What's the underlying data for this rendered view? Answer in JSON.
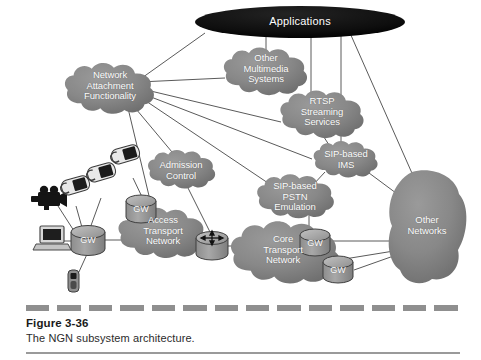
{
  "figure": {
    "caption_title": "Figure 3-36",
    "caption_text": "The NGN subsystem architecture.",
    "colors": {
      "cloud_fill": "#8a8a8a",
      "cloud_fill_dark": "#6f6f6f",
      "apps_fill": "#0d0d0d",
      "line": "#5a5a5a",
      "label_text": "#ffffff",
      "gw_fill": "#9d9d9d",
      "device_dark": "#1a1a1a",
      "dash_rule": "#8f8f8f"
    },
    "nodes": [
      {
        "id": "applications",
        "label": "Applications",
        "shape": "ellipse",
        "x": 300,
        "y": 22,
        "interactable": false
      },
      {
        "id": "network-attachment",
        "label": "Network\nAttachment\nFunctionality",
        "shape": "cloud",
        "x": 110,
        "y": 88,
        "interactable": false
      },
      {
        "id": "other-multimedia",
        "label": "Other\nMultimedia\nSystems",
        "shape": "cloud",
        "x": 265,
        "y": 70,
        "interactable": false
      },
      {
        "id": "rtsp-streaming",
        "label": "RTSP\nStreaming\nServices",
        "shape": "cloud",
        "x": 322,
        "y": 112,
        "interactable": false
      },
      {
        "id": "sip-ims",
        "label": "SIP-based\nIMS",
        "shape": "cloud",
        "x": 345,
        "y": 157,
        "interactable": false
      },
      {
        "id": "sip-pstn",
        "label": "SIP-based\nPSTN\nEmulation",
        "shape": "cloud",
        "x": 295,
        "y": 195,
        "interactable": false
      },
      {
        "id": "admission-control",
        "label": "Admission\nControl",
        "shape": "cloud",
        "x": 180,
        "y": 168,
        "interactable": false
      },
      {
        "id": "access-transport",
        "label": "Access\nTransport\nNetwork",
        "shape": "cloud",
        "x": 162,
        "y": 230,
        "interactable": false
      },
      {
        "id": "core-transport",
        "label": "Core\nTransport\nNetwork",
        "shape": "cloud",
        "x": 283,
        "y": 248,
        "interactable": false
      },
      {
        "id": "other-networks",
        "label": "Other\nNetworks",
        "shape": "cloud",
        "x": 425,
        "y": 228,
        "interactable": false
      }
    ],
    "gateways": [
      {
        "id": "gw-access-top",
        "label": "GW",
        "x": 141,
        "y": 207
      },
      {
        "id": "gw-cpe",
        "label": "GW",
        "x": 88,
        "y": 238
      },
      {
        "id": "gw-core-upper",
        "label": "GW",
        "x": 315,
        "y": 241
      },
      {
        "id": "gw-core-lower",
        "label": "GW",
        "x": 338,
        "y": 268
      }
    ],
    "devices": [
      {
        "id": "video-camera",
        "kind": "camera-icon",
        "x": 44,
        "y": 200
      },
      {
        "id": "phone-1",
        "kind": "telephone-icon",
        "x": 72,
        "y": 193
      },
      {
        "id": "phone-2",
        "kind": "telephone-icon",
        "x": 98,
        "y": 180
      },
      {
        "id": "phone-3",
        "kind": "telephone-icon",
        "x": 123,
        "y": 162
      },
      {
        "id": "laptop",
        "kind": "laptop-icon",
        "x": 50,
        "y": 236
      },
      {
        "id": "mobile-phone",
        "kind": "mobile-phone-icon",
        "x": 73,
        "y": 276
      },
      {
        "id": "router",
        "kind": "router-icon",
        "x": 212,
        "y": 245
      }
    ],
    "links": [
      {
        "from": "applications",
        "to": "network-attachment"
      },
      {
        "from": "applications",
        "to": "other-multimedia"
      },
      {
        "from": "applications",
        "to": "rtsp-streaming"
      },
      {
        "from": "applications",
        "to": "sip-ims"
      },
      {
        "from": "applications",
        "to": "other-networks"
      },
      {
        "from": "network-attachment",
        "to": "other-multimedia"
      },
      {
        "from": "network-attachment",
        "to": "rtsp-streaming"
      },
      {
        "from": "network-attachment",
        "to": "sip-ims"
      },
      {
        "from": "network-attachment",
        "to": "sip-pstn"
      },
      {
        "from": "network-attachment",
        "to": "admission-control"
      },
      {
        "from": "network-attachment",
        "to": "access-transport"
      },
      {
        "from": "rtsp-streaming",
        "to": "sip-ims"
      },
      {
        "from": "sip-ims",
        "to": "sip-pstn"
      },
      {
        "from": "sip-ims",
        "to": "other-networks"
      },
      {
        "from": "sip-pstn",
        "to": "core-transport"
      },
      {
        "from": "admission-control",
        "to": "router"
      },
      {
        "from": "access-transport",
        "to": "router"
      },
      {
        "from": "core-transport",
        "to": "router"
      },
      {
        "from": "core-transport",
        "to": "other-networks"
      },
      {
        "from": "gw-core-upper",
        "to": "other-networks"
      },
      {
        "from": "gw-core-lower",
        "to": "other-networks"
      },
      {
        "from": "gw-cpe",
        "to": "access-transport"
      },
      {
        "from": "gw-cpe",
        "to": "laptop"
      },
      {
        "from": "gw-cpe",
        "to": "mobile-phone"
      },
      {
        "from": "gw-cpe",
        "to": "phone-1"
      },
      {
        "from": "gw-cpe",
        "to": "phone-2"
      },
      {
        "from": "gw-cpe",
        "to": "video-camera"
      },
      {
        "from": "gw-access-top",
        "to": "phone-3"
      },
      {
        "from": "gw-access-top",
        "to": "access-transport"
      }
    ]
  }
}
